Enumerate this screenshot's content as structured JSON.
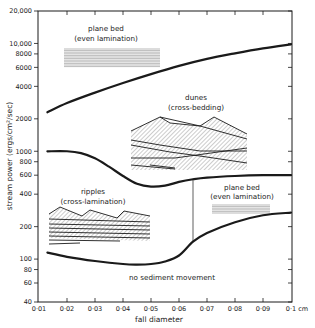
{
  "chart_data": {
    "type": "line",
    "title": "",
    "xlabel": "fall diameter",
    "x_unit": "cm",
    "ylabel": "stream power (ergs/cm²/sec)",
    "yscale": "log",
    "xlim": [
      0.01,
      0.1
    ],
    "ylim": [
      40,
      20000
    ],
    "x_ticks": [
      0.01,
      0.02,
      0.03,
      0.04,
      0.05,
      0.06,
      0.07,
      0.08,
      0.09,
      0.1
    ],
    "x_tick_labels": [
      "0·01",
      "0·02",
      "0·03",
      "0·04",
      "0·05",
      "0·06",
      "0·07",
      "0·08",
      "0·09",
      "0·1 cm"
    ],
    "y_ticks": [
      20000,
      10000,
      8000,
      6000,
      4000,
      2000,
      1000,
      800,
      600,
      400,
      200,
      100,
      80,
      60,
      40
    ],
    "y_tick_labels": [
      "20,000",
      "10,000",
      "8000",
      "6000",
      "4000",
      "2000",
      "1000",
      "800",
      "600",
      "400",
      "200",
      "100",
      "80",
      "60",
      "40"
    ],
    "grid": false,
    "series": [
      {
        "name": "upper boundary (dunes / upper plane bed)",
        "x": [
          0.013,
          0.02,
          0.03,
          0.04,
          0.05,
          0.06,
          0.07,
          0.08,
          0.09,
          0.1
        ],
        "values": [
          2300,
          2800,
          3500,
          4300,
          5200,
          6200,
          7200,
          8100,
          9000,
          9800
        ]
      },
      {
        "name": "middle boundary (ripples / dunes / lower plane bed)",
        "x": [
          0.013,
          0.02,
          0.025,
          0.03,
          0.035,
          0.04,
          0.045,
          0.05,
          0.055,
          0.06,
          0.065,
          0.07,
          0.08,
          0.09,
          0.1
        ],
        "values": [
          1000,
          1000,
          960,
          860,
          720,
          590,
          500,
          470,
          480,
          520,
          550,
          570,
          590,
          600,
          600
        ]
      },
      {
        "name": "lower boundary (threshold of sediment movement)",
        "x": [
          0.013,
          0.02,
          0.03,
          0.04,
          0.045,
          0.05,
          0.055,
          0.06,
          0.065,
          0.07,
          0.08,
          0.09,
          0.1
        ],
        "values": [
          115,
          105,
          96,
          90,
          89,
          90,
          95,
          108,
          145,
          175,
          220,
          255,
          270
        ]
      },
      {
        "name": "vertical divider (ripples / lower plane bed)",
        "x": [
          0.065,
          0.065
        ],
        "values": [
          145,
          550
        ]
      }
    ],
    "annotations": [
      {
        "text": "plane bed",
        "subtext": "(even lamination)",
        "region": "upper plane bed",
        "x": 0.035,
        "y": 12000
      },
      {
        "text": "dunes",
        "subtext": "(cross-bedding)",
        "region": "dunes",
        "x": 0.07,
        "y": 1700
      },
      {
        "text": "ripples",
        "subtext": "(cross-lamination)",
        "region": "ripples",
        "x": 0.025,
        "y": 290
      },
      {
        "text": "plane bed",
        "subtext": "(even lamination)",
        "region": "lower plane bed",
        "x": 0.082,
        "y": 360
      },
      {
        "text": "no sediment movement",
        "subtext": "",
        "region": "below threshold",
        "x": 0.065,
        "y": 65
      }
    ]
  },
  "labels": {
    "ylabel": "stream power (ergs/cm²/sec)",
    "xlabel": "fall diameter",
    "upper_plane_bed": "plane bed",
    "upper_plane_bed_sub": "(even lamination)",
    "dunes": "dunes",
    "dunes_sub": "(cross-bedding)",
    "ripples": "ripples",
    "ripples_sub": "(cross-lamination)",
    "lower_plane_bed": "plane bed",
    "lower_plane_bed_sub": "(even lamination)",
    "no_movement": "no sediment movement"
  },
  "colors": {
    "ink": "#1a1a1a",
    "hatch": "#9a9a9a",
    "stripe": "#8c8c8c",
    "background": "#ffffff"
  }
}
